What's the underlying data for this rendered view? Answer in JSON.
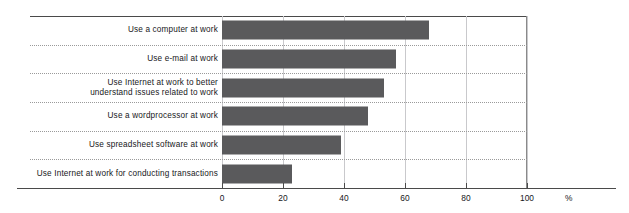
{
  "chart_data": {
    "type": "bar",
    "orientation": "horizontal",
    "title": "",
    "subtitle": "",
    "xlabel": "%",
    "ylabel": "",
    "categories": [
      "Use a computer at work",
      "Use e-mail at work",
      "Use Internet at work to better\nunderstand issues related to work",
      "Use a wordprocessor at work",
      "Use spreadsheet software at work",
      "Use Internet at work for conducting transactions"
    ],
    "values": [
      68,
      57,
      53,
      48,
      39,
      23
    ],
    "xlim": [
      0,
      100
    ],
    "xticks": [
      0,
      20,
      40,
      60,
      80,
      100
    ],
    "xtick_labels": [
      "0",
      "20",
      "40",
      "60",
      "80",
      "100"
    ],
    "grid": "vertical-major-and-horizontal-dotted-separators",
    "legend": "none",
    "bar_color": "#5a5a5c",
    "axis_color": "#4a4a4a",
    "gridline_color": "#c9c9cc",
    "separator_color": "#9a9a9a",
    "background": "#ffffff"
  },
  "axis": {
    "unit_label": "%"
  }
}
